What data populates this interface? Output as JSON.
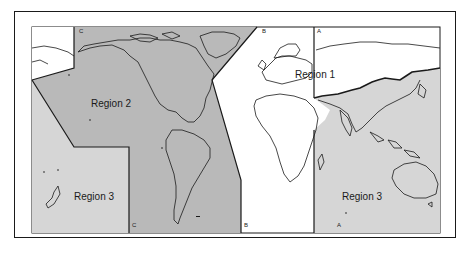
{
  "map": {
    "title": "",
    "regions": [
      {
        "id": "region-1",
        "label": "Region 1",
        "fill": "#ffffff"
      },
      {
        "id": "region-2",
        "label": "Region 2",
        "fill": "#b9b9b9"
      },
      {
        "id": "region-3-west",
        "label": "Region 3",
        "fill": "#d6d6d6"
      },
      {
        "id": "region-3-east",
        "label": "Region 3",
        "fill": "#d6d6d6"
      }
    ],
    "boundary_lines": {
      "a_top": "A",
      "a_bottom": "A",
      "b_top": "B",
      "b_bottom": "B",
      "c_top": "C",
      "c_bottom": "C"
    },
    "colors": {
      "border": "#1a1a1a",
      "coastline": "#1a1a1a",
      "region2": "#b9b9b9",
      "region3": "#d6d6d6",
      "region1": "#ffffff"
    }
  }
}
